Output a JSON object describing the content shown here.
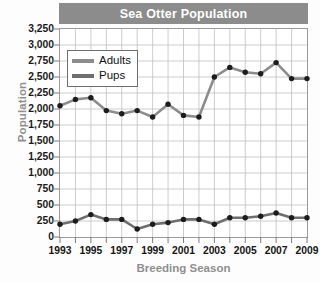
{
  "chart_data": {
    "type": "line",
    "title": "Sea Otter Population",
    "xlabel": "Breeding Season",
    "ylabel": "Population",
    "grid": true,
    "legend_position": "upper-left",
    "xlim": [
      1993,
      2009
    ],
    "ylim": [
      0,
      3250
    ],
    "y_tick_step": 250,
    "x_tick_step": 2,
    "x": [
      1993,
      1994,
      1995,
      1996,
      1997,
      1998,
      1999,
      2000,
      2001,
      2002,
      2003,
      2004,
      2005,
      2006,
      2007,
      2008,
      2009
    ],
    "x_tick_labels": [
      "1993",
      "1995",
      "1997",
      "1999",
      "2001",
      "2003",
      "2005",
      "2007",
      "2009"
    ],
    "x_tick_values": [
      1993,
      1995,
      1997,
      1999,
      2001,
      2003,
      2005,
      2007,
      2009
    ],
    "y_tick_labels": [
      "3,250",
      "3,000",
      "2,750",
      "2,500",
      "2,250",
      "2,000",
      "1,750",
      "1,500",
      "1,250",
      "1,000",
      "750",
      "500",
      "250",
      "0"
    ],
    "y_tick_values": [
      3250,
      3000,
      2750,
      2500,
      2250,
      2000,
      1750,
      1500,
      1250,
      1000,
      750,
      500,
      250,
      0
    ],
    "series": [
      {
        "name": "Adults",
        "color": "#8c8c8c",
        "marker_color": "#1c1c1c",
        "values": [
          2050,
          2150,
          2175,
          1975,
          1925,
          1975,
          1875,
          2075,
          1900,
          1875,
          2500,
          2650,
          2575,
          2550,
          2725,
          2475,
          2475
        ]
      },
      {
        "name": "Pups",
        "color": "#6e6e6e",
        "marker_color": "#1c1c1c",
        "values": [
          200,
          250,
          350,
          275,
          275,
          125,
          200,
          225,
          275,
          275,
          200,
          300,
          300,
          325,
          375,
          300,
          300
        ]
      }
    ],
    "annotations": []
  },
  "legend": {
    "entries": [
      {
        "label": "Adults"
      },
      {
        "label": "Pups"
      }
    ]
  }
}
